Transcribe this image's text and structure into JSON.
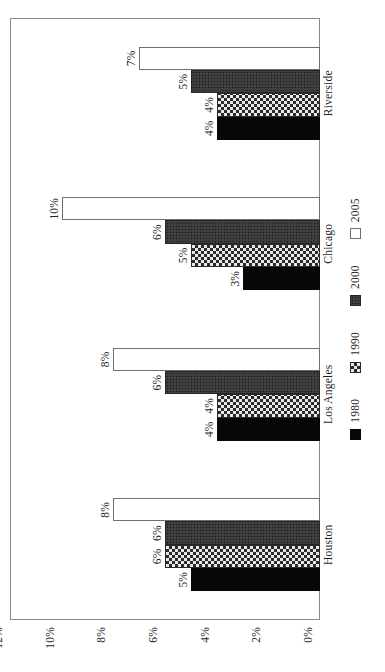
{
  "chart_data": {
    "type": "bar",
    "title": "",
    "subtitle": "",
    "xlabel": "",
    "ylabel": "",
    "categories": [
      "Houston",
      "Los Angeles",
      "Chicago",
      "Riverside"
    ],
    "series": [
      {
        "name": "1980",
        "values": [
          5,
          4,
          3,
          4
        ],
        "color": "#070707",
        "pattern": "solid-black"
      },
      {
        "name": "1990",
        "values": [
          6,
          4,
          5,
          4
        ],
        "color": "#e8e8e8",
        "pattern": "checkerboard"
      },
      {
        "name": "2000",
        "values": [
          6,
          6,
          6,
          5
        ],
        "color": "#3b3b3b",
        "pattern": "dense-dark-dotted"
      },
      {
        "name": "2005",
        "values": [
          8,
          8,
          10,
          7
        ],
        "color": "#ffffff",
        "pattern": "open-white"
      }
    ],
    "data_labels": [
      [
        "5%",
        "6%",
        "6%",
        "8%"
      ],
      [
        "4%",
        "4%",
        "6%",
        "8%"
      ],
      [
        "3%",
        "5%",
        "6%",
        "10%"
      ],
      [
        "4%",
        "4%",
        "5%",
        "7%"
      ]
    ],
    "ylim": [
      0,
      12
    ],
    "ytick_values": [
      0,
      2,
      4,
      6,
      8,
      10,
      12
    ],
    "ytick_labels": [
      "0%",
      "2%",
      "4%",
      "6%",
      "8%",
      "10%",
      "12%"
    ],
    "grid": false,
    "legend_position": "bottom",
    "legend_entries": [
      "1980",
      "1990",
      "2000",
      "2005"
    ],
    "orientation": "figure rotated 90 degrees counter-clockwise"
  },
  "figure": {
    "rotation_note": "page-rotated"
  }
}
